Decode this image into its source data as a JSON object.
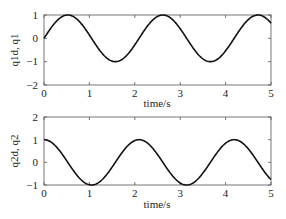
{
  "chart_data": [
    {
      "type": "line",
      "title": "",
      "xlabel": "time/s",
      "ylabel": "q1d, q1",
      "xlim": [
        0,
        5
      ],
      "ylim": [
        -2,
        1
      ],
      "xticks": [
        "0",
        "1",
        "2",
        "3",
        "4",
        "5"
      ],
      "yticks": [
        "1",
        "0",
        "-1",
        "-2"
      ],
      "grid": false,
      "legend": null,
      "series": [
        {
          "name": "q1d / q1",
          "formula": "sin(3t)",
          "x": [
            0,
            0.25,
            0.52,
            0.75,
            1.0,
            1.25,
            1.57,
            1.75,
            2.0,
            2.25,
            2.6,
            2.75,
            3.0,
            3.25,
            3.66,
            3.9,
            4.2,
            4.45,
            4.71,
            4.9,
            5.0
          ],
          "y": [
            0,
            0.68,
            1.0,
            0.78,
            0.14,
            -0.57,
            -1.0,
            -0.86,
            -0.28,
            0.45,
            1.0,
            0.91,
            0.41,
            -0.32,
            -1.0,
            -0.72,
            0.03,
            0.7,
            1.0,
            0.86,
            0.65
          ]
        }
      ]
    },
    {
      "type": "line",
      "title": "",
      "xlabel": "time/s",
      "ylabel": "q2d, q2",
      "xlim": [
        0,
        5
      ],
      "ylim": [
        -1,
        2
      ],
      "xticks": [
        "0",
        "1",
        "2",
        "3",
        "4",
        "5"
      ],
      "yticks": [
        "2",
        "1",
        "0",
        "-1"
      ],
      "grid": false,
      "legend": null,
      "series": [
        {
          "name": "q2d / q2",
          "formula": "cos(3t)",
          "x": [
            0,
            0.25,
            0.5,
            0.75,
            1.05,
            1.25,
            1.5,
            1.75,
            2.09,
            2.25,
            2.5,
            2.75,
            3.14,
            3.4,
            3.65,
            3.9,
            4.19,
            4.4,
            4.65,
            4.9,
            5.0
          ],
          "y": [
            1.0,
            0.73,
            0.07,
            -0.63,
            -1.0,
            -0.82,
            -0.21,
            0.52,
            1.0,
            0.9,
            0.35,
            -0.39,
            -1.0,
            -0.74,
            0.0,
            0.65,
            1.0,
            0.83,
            0.23,
            -0.51,
            -0.76
          ]
        }
      ]
    }
  ],
  "plots": {
    "top": {
      "ylabel": "q1d, q1",
      "xlabel": "time/s",
      "yticks": [
        "1",
        "0",
        "−1",
        "−2"
      ],
      "xticks": [
        "0",
        "1",
        "2",
        "3",
        "4",
        "5"
      ]
    },
    "bottom": {
      "ylabel": "q2d, q2",
      "xlabel": "time/s",
      "yticks": [
        "2",
        "1",
        "0",
        "−1"
      ],
      "xticks": [
        "0",
        "1",
        "2",
        "3",
        "4",
        "5"
      ]
    }
  }
}
